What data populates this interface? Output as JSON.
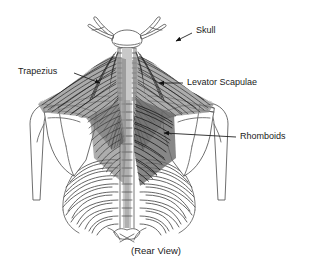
{
  "figure": {
    "title_caption": "(Rear View)",
    "view": "Rear View",
    "background_color": "#ffffff",
    "line_color": "#555555",
    "label_color": "#1a1a1a",
    "muscle_shade_dark": "#3a3a3a",
    "muscle_shade_mid": "#6e6e6e",
    "spine_highlight": "#c9c9c9"
  },
  "labels": [
    {
      "id": "skull",
      "text": "Skull",
      "text_x": 196,
      "text_y": 31,
      "anchor": "start",
      "leader": "M 192 33 L 176 41",
      "arrow_x": 172,
      "arrow_y": 44,
      "arrow_rotation": 205,
      "has_arrow": true
    },
    {
      "id": "trapezius",
      "text": "Trapezius",
      "text_x": 18,
      "text_y": 72,
      "anchor": "start",
      "leader": "M 74 73 L 100 83",
      "arrow_x": 104,
      "arrow_y": 85,
      "arrow_rotation": 21,
      "has_arrow": true
    },
    {
      "id": "levator-scapulae",
      "text": "Levator Scapulae",
      "text_x": 187,
      "text_y": 83,
      "anchor": "start",
      "leader": "M 183 83 L 160 83",
      "arrow_x": 155,
      "arrow_y": 83,
      "arrow_rotation": 180,
      "has_arrow": true
    },
    {
      "id": "rhomboids",
      "text": "Rhomboids",
      "text_x": 240,
      "text_y": 137,
      "anchor": "start",
      "leader": "M 236 137 L 165 133",
      "arrow_x": 160,
      "arrow_y": 133,
      "arrow_rotation": 184,
      "has_arrow": true
    }
  ],
  "anatomy_parts": [
    {
      "name": "skull-base",
      "label": "Skull"
    },
    {
      "name": "mandible-left",
      "label": "Mandible (left)"
    },
    {
      "name": "mandible-right",
      "label": "Mandible (right)"
    },
    {
      "name": "cervical-spine",
      "label": "Cervical vertebrae"
    },
    {
      "name": "thoracic-spine",
      "label": "Thoracic vertebrae"
    },
    {
      "name": "clavicle-left",
      "label": "Clavicle (left)"
    },
    {
      "name": "clavicle-right",
      "label": "Clavicle (right)"
    },
    {
      "name": "scapula-left",
      "label": "Scapula (left)"
    },
    {
      "name": "scapula-right",
      "label": "Scapula (right)"
    },
    {
      "name": "humerus-left",
      "label": "Humerus (left)"
    },
    {
      "name": "humerus-right",
      "label": "Humerus (right)"
    },
    {
      "name": "ribcage-left",
      "label": "Rib cage (left)"
    },
    {
      "name": "ribcage-right",
      "label": "Rib cage (right)"
    },
    {
      "name": "trapezius-muscle",
      "label": "Trapezius muscle"
    },
    {
      "name": "levator-scapulae-muscle",
      "label": "Levator scapulae muscle"
    },
    {
      "name": "rhomboid-muscle",
      "label": "Rhomboid muscle"
    }
  ],
  "caption": {
    "text": "(Rear View)",
    "x": 156,
    "y": 251
  }
}
